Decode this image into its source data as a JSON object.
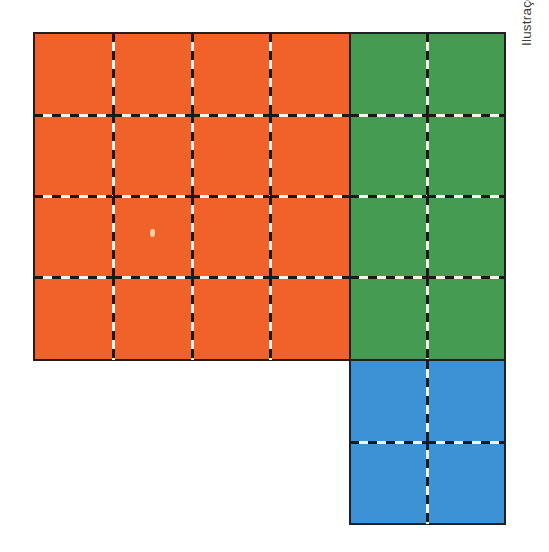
{
  "figure": {
    "credit": "Ilustrações: DAE",
    "background_color": "#ffffff",
    "outline_color": "#231f20",
    "dash_dark_color": "#1a1a1a",
    "dash_light_color": "#f7f2ea"
  },
  "regions": [
    {
      "id": "orange-region",
      "name": "orange",
      "label": "Região laranja",
      "color": "#f1622a",
      "columns": 4,
      "rows": 4,
      "unit_squares": 16,
      "position": {
        "x": 33,
        "y": 32,
        "width": 318,
        "height": 329
      }
    },
    {
      "id": "green-region",
      "name": "green",
      "label": "Região verde",
      "color": "#459b52",
      "columns": 2,
      "rows": 4,
      "unit_squares": 8,
      "position": {
        "x": 349,
        "y": 32,
        "width": 157,
        "height": 329
      }
    },
    {
      "id": "blue-region",
      "name": "blue",
      "label": "Região azul",
      "color": "#3c92d5",
      "columns": 2,
      "rows": 2,
      "unit_squares": 4,
      "position": {
        "x": 349,
        "y": 359,
        "width": 157,
        "height": 166
      }
    }
  ],
  "chart_data": {
    "type": "bar",
    "xlabel": "Cor da região",
    "ylabel": "Quantidade de quadradinhos",
    "categories": [
      "Laranja",
      "Verde",
      "Azul"
    ],
    "values": [
      16,
      8,
      4
    ],
    "ylim": [
      0,
      16
    ],
    "grid": false,
    "legend": false,
    "colors": [
      "#f1622a",
      "#459b52",
      "#3c92d5"
    ],
    "annotations": [
      "Região laranja: 4 colunas x 4 linhas = 16 quadradinhos",
      "Região verde: 2 colunas x 4 linhas = 8 quadradinhos",
      "Região azul: 2 colunas x 2 linhas = 4 quadradinhos",
      "Total: 28 quadradinhos"
    ],
    "total": 28
  }
}
